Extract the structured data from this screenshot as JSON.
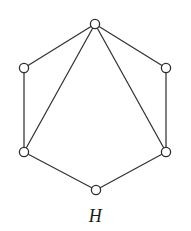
{
  "figure": {
    "label": "H",
    "caption_position": "below",
    "background_color": "#ffffff",
    "edge_color": "#333333",
    "vertex_stroke_color": "#2e2e2e",
    "vertex_fill_color": "#ffffff",
    "label_color": "#1a1a1a"
  },
  "graph": {
    "name": "H",
    "vertex_count": 6,
    "edge_count": 8,
    "layout": "hexagonal",
    "vertices": [
      {
        "id": "top",
        "cx": 95,
        "cy": 24,
        "r": 4.6,
        "degree": 4
      },
      {
        "id": "upper-right",
        "cx": 166,
        "cy": 68,
        "r": 4.6,
        "degree": 2
      },
      {
        "id": "lower-right",
        "cx": 166,
        "cy": 152,
        "r": 4.6,
        "degree": 3
      },
      {
        "id": "bottom",
        "cx": 96,
        "cy": 190,
        "r": 4.6,
        "degree": 2
      },
      {
        "id": "lower-left",
        "cx": 24,
        "cy": 152,
        "r": 4.6,
        "degree": 3
      },
      {
        "id": "upper-left",
        "cx": 24,
        "cy": 68,
        "r": 4.6,
        "degree": 2
      }
    ],
    "edges": [
      {
        "id": "e1",
        "from": "top",
        "to": "upper-right",
        "x1": 95,
        "y1": 24,
        "x2": 166,
        "y2": 68,
        "kind": "cycle"
      },
      {
        "id": "e2",
        "from": "upper-right",
        "to": "lower-right",
        "x1": 166,
        "y1": 68,
        "x2": 166,
        "y2": 152,
        "kind": "cycle"
      },
      {
        "id": "e3",
        "from": "lower-right",
        "to": "bottom",
        "x1": 166,
        "y1": 152,
        "x2": 96,
        "y2": 190,
        "kind": "cycle"
      },
      {
        "id": "e4",
        "from": "bottom",
        "to": "lower-left",
        "x1": 96,
        "y1": 190,
        "x2": 24,
        "y2": 152,
        "kind": "cycle"
      },
      {
        "id": "e5",
        "from": "lower-left",
        "to": "upper-left",
        "x1": 24,
        "y1": 152,
        "x2": 24,
        "y2": 68,
        "kind": "cycle"
      },
      {
        "id": "e6",
        "from": "upper-left",
        "to": "top",
        "x1": 24,
        "y1": 68,
        "x2": 95,
        "y2": 24,
        "kind": "cycle"
      },
      {
        "id": "e7",
        "from": "top",
        "to": "lower-left",
        "x1": 95,
        "y1": 24,
        "x2": 24,
        "y2": 152,
        "kind": "chord"
      },
      {
        "id": "e8",
        "from": "top",
        "to": "lower-right",
        "x1": 95,
        "y1": 24,
        "x2": 166,
        "y2": 152,
        "kind": "chord"
      }
    ]
  }
}
